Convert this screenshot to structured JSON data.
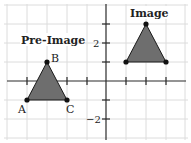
{
  "figure": {
    "pre_image_title": "Pre-Image",
    "image_title": "Image",
    "y_tick_labels": {
      "pos2": "2",
      "neg2": "−2"
    },
    "vertex_labels": {
      "A": "A",
      "B": "B",
      "C": "C"
    },
    "colors": {
      "triangle_fill": "#6e6e6e",
      "grid": "#dcdcdc",
      "axis": "#2a2a2a"
    }
  },
  "diagram_data": {
    "type": "coordinate-plane-translation",
    "grid_range": {
      "x": [
        -5,
        4
      ],
      "y": [
        -3,
        4
      ]
    },
    "pre_image": {
      "label": "Pre-Image",
      "vertices": [
        {
          "name": "A",
          "x": -4,
          "y": -1
        },
        {
          "name": "B",
          "x": -3,
          "y": 1
        },
        {
          "name": "C",
          "x": -2,
          "y": -1
        }
      ]
    },
    "image": {
      "label": "Image",
      "vertices": [
        {
          "x": 1,
          "y": 1
        },
        {
          "x": 2,
          "y": 3
        },
        {
          "x": 3,
          "y": 1
        }
      ]
    },
    "labeled_y_ticks": [
      2,
      -2
    ]
  }
}
